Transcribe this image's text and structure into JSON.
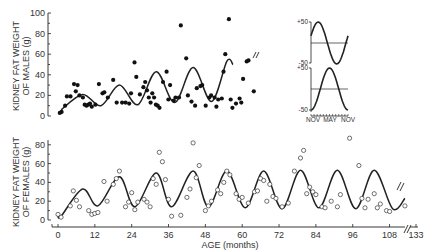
{
  "chart_data": [
    {
      "type": "scatter",
      "panel": "males",
      "ylabel": "KIDNEY FAT WEIGHT OF MALES (g)",
      "xlabel": "AGE (months)",
      "ylim": [
        0,
        100
      ],
      "yticks": [
        0,
        20,
        40,
        60,
        80,
        100
      ],
      "marker": "filled-circle",
      "points": [
        [
          1,
          3
        ],
        [
          2,
          4
        ],
        [
          4,
          10
        ],
        [
          5,
          19
        ],
        [
          7,
          19
        ],
        [
          9,
          31
        ],
        [
          10,
          24
        ],
        [
          11,
          30
        ],
        [
          12,
          20
        ],
        [
          14,
          18
        ],
        [
          15,
          11
        ],
        [
          16,
          10
        ],
        [
          17,
          11
        ],
        [
          18,
          12
        ],
        [
          19,
          9
        ],
        [
          21,
          11
        ],
        [
          23,
          31
        ],
        [
          25,
          22
        ],
        [
          26,
          23
        ],
        [
          28,
          18
        ],
        [
          31,
          35
        ],
        [
          33,
          13
        ],
        [
          36,
          13
        ],
        [
          38,
          13
        ],
        [
          40,
          12
        ],
        [
          41,
          22
        ],
        [
          43,
          52
        ],
        [
          44,
          38
        ],
        [
          46,
          21
        ],
        [
          48,
          28
        ],
        [
          49,
          33
        ],
        [
          50,
          25
        ],
        [
          51,
          18
        ],
        [
          52,
          13
        ],
        [
          53,
          22
        ],
        [
          54,
          18
        ],
        [
          55,
          11
        ],
        [
          56,
          10
        ],
        [
          57,
          8
        ],
        [
          59,
          33
        ],
        [
          61,
          43
        ],
        [
          62,
          16
        ],
        [
          63,
          30
        ],
        [
          65,
          15
        ],
        [
          66,
          18
        ],
        [
          68,
          18
        ],
        [
          69,
          88
        ],
        [
          72,
          56
        ],
        [
          73,
          20
        ],
        [
          75,
          14
        ],
        [
          77,
          10
        ],
        [
          78,
          27
        ],
        [
          80,
          29
        ],
        [
          81,
          30
        ],
        [
          83,
          10
        ],
        [
          85,
          18
        ],
        [
          86,
          20
        ],
        [
          88,
          18
        ],
        [
          89,
          9
        ],
        [
          90,
          16
        ],
        [
          92,
          17
        ],
        [
          93,
          43
        ],
        [
          94,
          60
        ],
        [
          96,
          94
        ],
        [
          97,
          16
        ],
        [
          98,
          8
        ],
        [
          100,
          12
        ],
        [
          102,
          17
        ],
        [
          103,
          13
        ],
        [
          104,
          36
        ],
        [
          106,
          53
        ],
        [
          107,
          54
        ],
        [
          110,
          24
        ]
      ],
      "curve_note": "Fitted seasonal sinusoid with increasing amplitude, peaks ~21g at 8 mo, ~30g at 20 mo, ~43g at 32 mo, ~48g at 44 mo, ~55g at 55 mo; troughs ~10-12g"
    },
    {
      "type": "scatter",
      "panel": "females",
      "ylabel": "KIDNEY FAT WEIGHT OF FEMALES (g)",
      "xlabel": "AGE (months)",
      "ylim": [
        0,
        80
      ],
      "yticks": [
        0,
        20,
        40,
        60,
        80
      ],
      "xticks": [
        0,
        12,
        24,
        36,
        48,
        60,
        72,
        84,
        96,
        108,
        133
      ],
      "x_axis_break_between": [
        108,
        133
      ],
      "marker": "open-circle",
      "points": [
        [
          0,
          6
        ],
        [
          1,
          3
        ],
        [
          4,
          15
        ],
        [
          5,
          31
        ],
        [
          6,
          21
        ],
        [
          7,
          14
        ],
        [
          10,
          10
        ],
        [
          11,
          6
        ],
        [
          12,
          7
        ],
        [
          13,
          8
        ],
        [
          15,
          41
        ],
        [
          16,
          20
        ],
        [
          18,
          38
        ],
        [
          19,
          44
        ],
        [
          20,
          52
        ],
        [
          22,
          14
        ],
        [
          23,
          19
        ],
        [
          24,
          29
        ],
        [
          25,
          11
        ],
        [
          26,
          19
        ],
        [
          28,
          22
        ],
        [
          29,
          19
        ],
        [
          30,
          14
        ],
        [
          31,
          44
        ],
        [
          32,
          38
        ],
        [
          33,
          72
        ],
        [
          34,
          62
        ],
        [
          35,
          43
        ],
        [
          36,
          22
        ],
        [
          37,
          4
        ],
        [
          40,
          5
        ],
        [
          42,
          24
        ],
        [
          43,
          33
        ],
        [
          44,
          82
        ],
        [
          45,
          45
        ],
        [
          46,
          58
        ],
        [
          48,
          10
        ],
        [
          49,
          15
        ],
        [
          50,
          20
        ],
        [
          52,
          32
        ],
        [
          53,
          28
        ],
        [
          54,
          40
        ],
        [
          55,
          52
        ],
        [
          56,
          48
        ],
        [
          58,
          28
        ],
        [
          59,
          22
        ],
        [
          60,
          24
        ],
        [
          62,
          18
        ],
        [
          64,
          30
        ],
        [
          65,
          31
        ],
        [
          66,
          44
        ],
        [
          67,
          42
        ],
        [
          68,
          20
        ],
        [
          69,
          38
        ],
        [
          70,
          25
        ],
        [
          71,
          23
        ],
        [
          73,
          14
        ],
        [
          75,
          18
        ],
        [
          77,
          52
        ],
        [
          79,
          66
        ],
        [
          80,
          74
        ],
        [
          81,
          28
        ],
        [
          82,
          35
        ],
        [
          83,
          30
        ],
        [
          84,
          27
        ],
        [
          86,
          14
        ],
        [
          87,
          13
        ],
        [
          89,
          20
        ],
        [
          91,
          14
        ],
        [
          92,
          27
        ],
        [
          95,
          87
        ],
        [
          98,
          58
        ],
        [
          99,
          23
        ],
        [
          100,
          13
        ],
        [
          101,
          22
        ],
        [
          103,
          28
        ],
        [
          104,
          13
        ],
        [
          105,
          17
        ],
        [
          107,
          10
        ],
        [
          108,
          9
        ],
        [
          113,
          15
        ]
      ],
      "curve_note": "Fitted seasonal sinusoid, peaks ~33g at 8 mo, ~46g at 20 mo, then ~50-53g each ~12 months; troughs ~12-15g"
    },
    {
      "type": "line",
      "panel": "inset",
      "subplots": [
        {
          "ylim": [
            -50,
            50
          ],
          "yticks": [
            "+50",
            "-50"
          ],
          "shape": "sine, peak near Jan/Feb, trough near Sep/Oct"
        },
        {
          "ylim": [
            -50,
            50
          ],
          "yticks": [
            "+50",
            "-50"
          ],
          "shape": "sine, peak near May, trough near Nov"
        }
      ],
      "xticks": [
        "NOV",
        "MAY",
        "NOV"
      ]
    }
  ],
  "labels": {
    "males_ylabel_line1": "KIDNEY FAT WEIGHT",
    "males_ylabel_line2": "OF MALES (g)",
    "females_ylabel_line1": "KIDNEY FAT WEIGHT",
    "females_ylabel_line2": "OF FEMALES (g)",
    "xlabel": "AGE (months)",
    "males_yticks": [
      "0",
      "20",
      "40",
      "60",
      "80",
      "100"
    ],
    "females_yticks": [
      "0",
      "20",
      "40",
      "60",
      "80"
    ],
    "xticks": [
      "0",
      "12",
      "24",
      "36",
      "48",
      "60",
      "72",
      "84",
      "96",
      "108",
      "133"
    ],
    "inset_top_max": "+50",
    "inset_top_min": "-50",
    "inset_bot_max": "+50",
    "inset_bot_min": "-50",
    "inset_x": [
      "NOV",
      "MAY",
      "NOV"
    ]
  },
  "colors": {
    "ink": "#222222",
    "background": "#ffffff"
  }
}
